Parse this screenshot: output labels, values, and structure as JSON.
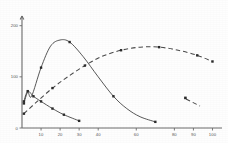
{
  "chart_data": {
    "type": "line",
    "title": "",
    "subtitle": "",
    "xlabel": "",
    "ylabel": "",
    "xlim": [
      0,
      105
    ],
    "ylim": [
      0,
      215
    ],
    "grid": false,
    "legend_position": "inside-right",
    "x_ticks": [
      10,
      20,
      30,
      40,
      60,
      80,
      90,
      100
    ],
    "x_tick_labels": [
      "10",
      "20",
      "30",
      "40",
      "60",
      "80",
      "90",
      "100"
    ],
    "y_ticks": [
      0,
      100,
      200
    ],
    "y_tick_labels": [
      "0",
      "100",
      "200"
    ],
    "series": [
      {
        "name": "peaked-solid-curve",
        "style": "solid",
        "marker": "square",
        "x": [
          1,
          3,
          5,
          10,
          15,
          20,
          25,
          32,
          40,
          48,
          55,
          62,
          70
        ],
        "y": [
          48,
          70,
          62,
          118,
          160,
          172,
          168,
          140,
          100,
          62,
          38,
          22,
          12
        ]
      },
      {
        "name": "broad-dashed-curve",
        "style": "dashed",
        "marker": "square",
        "x": [
          1,
          8,
          16,
          24,
          33,
          42,
          52,
          62,
          72,
          82,
          92,
          100
        ],
        "y": [
          28,
          52,
          78,
          100,
          122,
          140,
          152,
          158,
          158,
          152,
          142,
          130
        ]
      },
      {
        "name": "declining-solid-curve",
        "style": "solid",
        "marker": "square",
        "x": [
          1,
          3,
          6,
          10,
          16,
          22,
          30
        ],
        "y": [
          52,
          72,
          62,
          52,
          38,
          26,
          14
        ]
      }
    ],
    "legend": [
      {
        "label": "",
        "style": "dashed",
        "marker": "square"
      }
    ]
  }
}
